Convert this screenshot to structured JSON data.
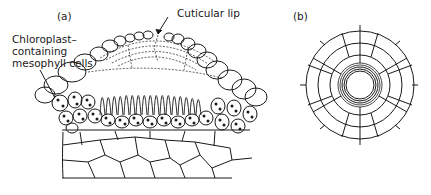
{
  "figure": {
    "panels": [
      {
        "id": "a",
        "label": "(a)",
        "description": "Cross section of leaf showing papilla with cuticular lip and palisade cells"
      },
      {
        "id": "b",
        "label": "(b)",
        "description": "Surface view of cells radiating around a central pore"
      }
    ],
    "annotations": {
      "cuticular_lip": "Cuticular lip",
      "chloroplast_line1": "Chloroplast–",
      "chloroplast_line2": "containing",
      "chloroplast_line3": "mesophyll cells"
    },
    "colors": {
      "ink": "#1a1a1a",
      "background": "#ffffff"
    }
  }
}
